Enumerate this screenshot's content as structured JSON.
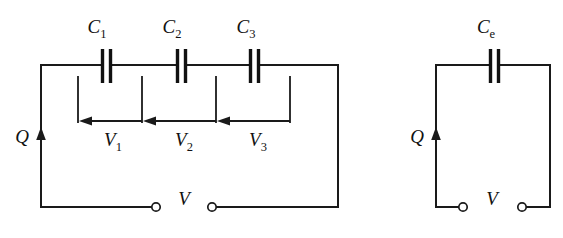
{
  "figure": {
    "background_color": "#ffffff",
    "line_color": "#1a1a1a"
  },
  "left_circuit": {
    "name": "series-capacitor-circuit",
    "capacitors": [
      {
        "label_base": "C",
        "label_sub": "1",
        "full": "C1"
      },
      {
        "label_base": "C",
        "label_sub": "2",
        "full": "C2"
      },
      {
        "label_base": "C",
        "label_sub": "3",
        "full": "C3"
      }
    ],
    "voltages": [
      {
        "label_base": "V",
        "label_sub": "1",
        "full": "V1"
      },
      {
        "label_base": "V",
        "label_sub": "2",
        "full": "V2"
      },
      {
        "label_base": "V",
        "label_sub": "3",
        "full": "V3"
      }
    ],
    "charge_label": "Q",
    "source_label": "V"
  },
  "right_circuit": {
    "name": "equivalent-capacitor-circuit",
    "capacitor": {
      "label_base": "C",
      "label_sub": "e",
      "full": "Ce"
    },
    "charge_label": "Q",
    "source_label": "V"
  }
}
